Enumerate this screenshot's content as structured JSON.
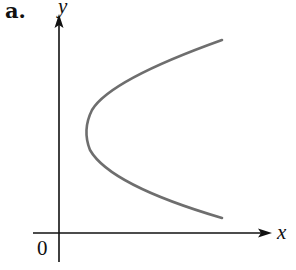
{
  "figure": {
    "panel_label": "a.",
    "x_axis_label": "x",
    "y_axis_label": "y",
    "origin_label": "0",
    "curve_color": "#6e6e6e",
    "axis_color": "#111111",
    "curve_description": "sideways parabola opening to the right (x = a·y² + c form), vertex right of y-axis"
  }
}
